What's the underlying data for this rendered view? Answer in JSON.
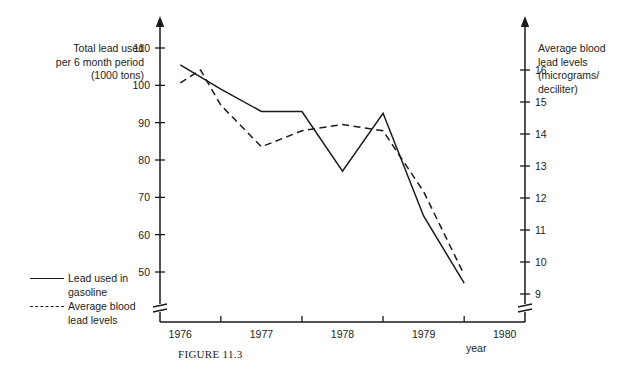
{
  "figure": {
    "caption": "FIGURE 11.3",
    "left_axis_title": "Total lead used\nper 6 month period\n(1000 tons)",
    "right_axis_title": "Average blood\nlead levels\n(micrograms/\ndeciliter)",
    "xaxis_unit_label": "year"
  },
  "legend": {
    "position": "bottom-left",
    "entries": [
      {
        "label": "Lead used in\ngasoline",
        "style": "solid",
        "key": "solid-line-swatch"
      },
      {
        "label": "Average blood\nlead levels",
        "style": "dashed",
        "key": "dashed-line-swatch"
      }
    ]
  },
  "chart_data": {
    "type": "line",
    "title": "",
    "subtitle": "",
    "xlabel": "year",
    "ylabel": "Total lead used per 6 month period (1000 tons)",
    "y2label": "Average blood lead levels (micrograms/deciliter)",
    "grid": false,
    "axis_break": true,
    "xlim": [
      1975.75,
      1980.25
    ],
    "x_tick_labels": [
      "1976",
      "1977",
      "1978",
      "1979",
      "1980"
    ],
    "x_tick_values": [
      1976,
      1977,
      1978,
      1979,
      1980
    ],
    "x_minor_ticks": [
      1976.5,
      1977.5,
      1978.5,
      1979.5
    ],
    "ylim": [
      45,
      112
    ],
    "y_tick_labels": [
      "110",
      "100",
      "90",
      "80",
      "70",
      "60",
      "50"
    ],
    "y_tick_values": [
      110,
      100,
      90,
      80,
      70,
      60,
      50
    ],
    "y2lim": [
      8.7,
      16.6
    ],
    "y2_tick_labels": [
      "16",
      "15",
      "14",
      "13",
      "12",
      "11",
      "10",
      "9"
    ],
    "y2_tick_values": [
      16,
      15,
      14,
      13,
      12,
      11,
      10,
      9
    ],
    "series": [
      {
        "name": "Lead used in gasoline",
        "style": "solid",
        "axis": "left",
        "units": "1000 tons per 6 month period",
        "x": [
          1976.0,
          1976.5,
          1977.0,
          1977.5,
          1978.0,
          1978.5,
          1979.0,
          1979.5
        ],
        "values": [
          105.5,
          99.0,
          93.0,
          93.0,
          77.0,
          92.5,
          65.0,
          47.0
        ]
      },
      {
        "name": "Average blood lead levels",
        "style": "dashed",
        "axis": "right",
        "units": "micrograms/deciliter",
        "x": [
          1976.0,
          1976.25,
          1976.5,
          1977.0,
          1977.5,
          1978.0,
          1978.5,
          1979.0,
          1979.5
        ],
        "values": [
          15.6,
          16.0,
          14.9,
          13.6,
          14.1,
          14.3,
          14.1,
          12.2,
          9.6
        ]
      }
    ],
    "annotations": []
  }
}
